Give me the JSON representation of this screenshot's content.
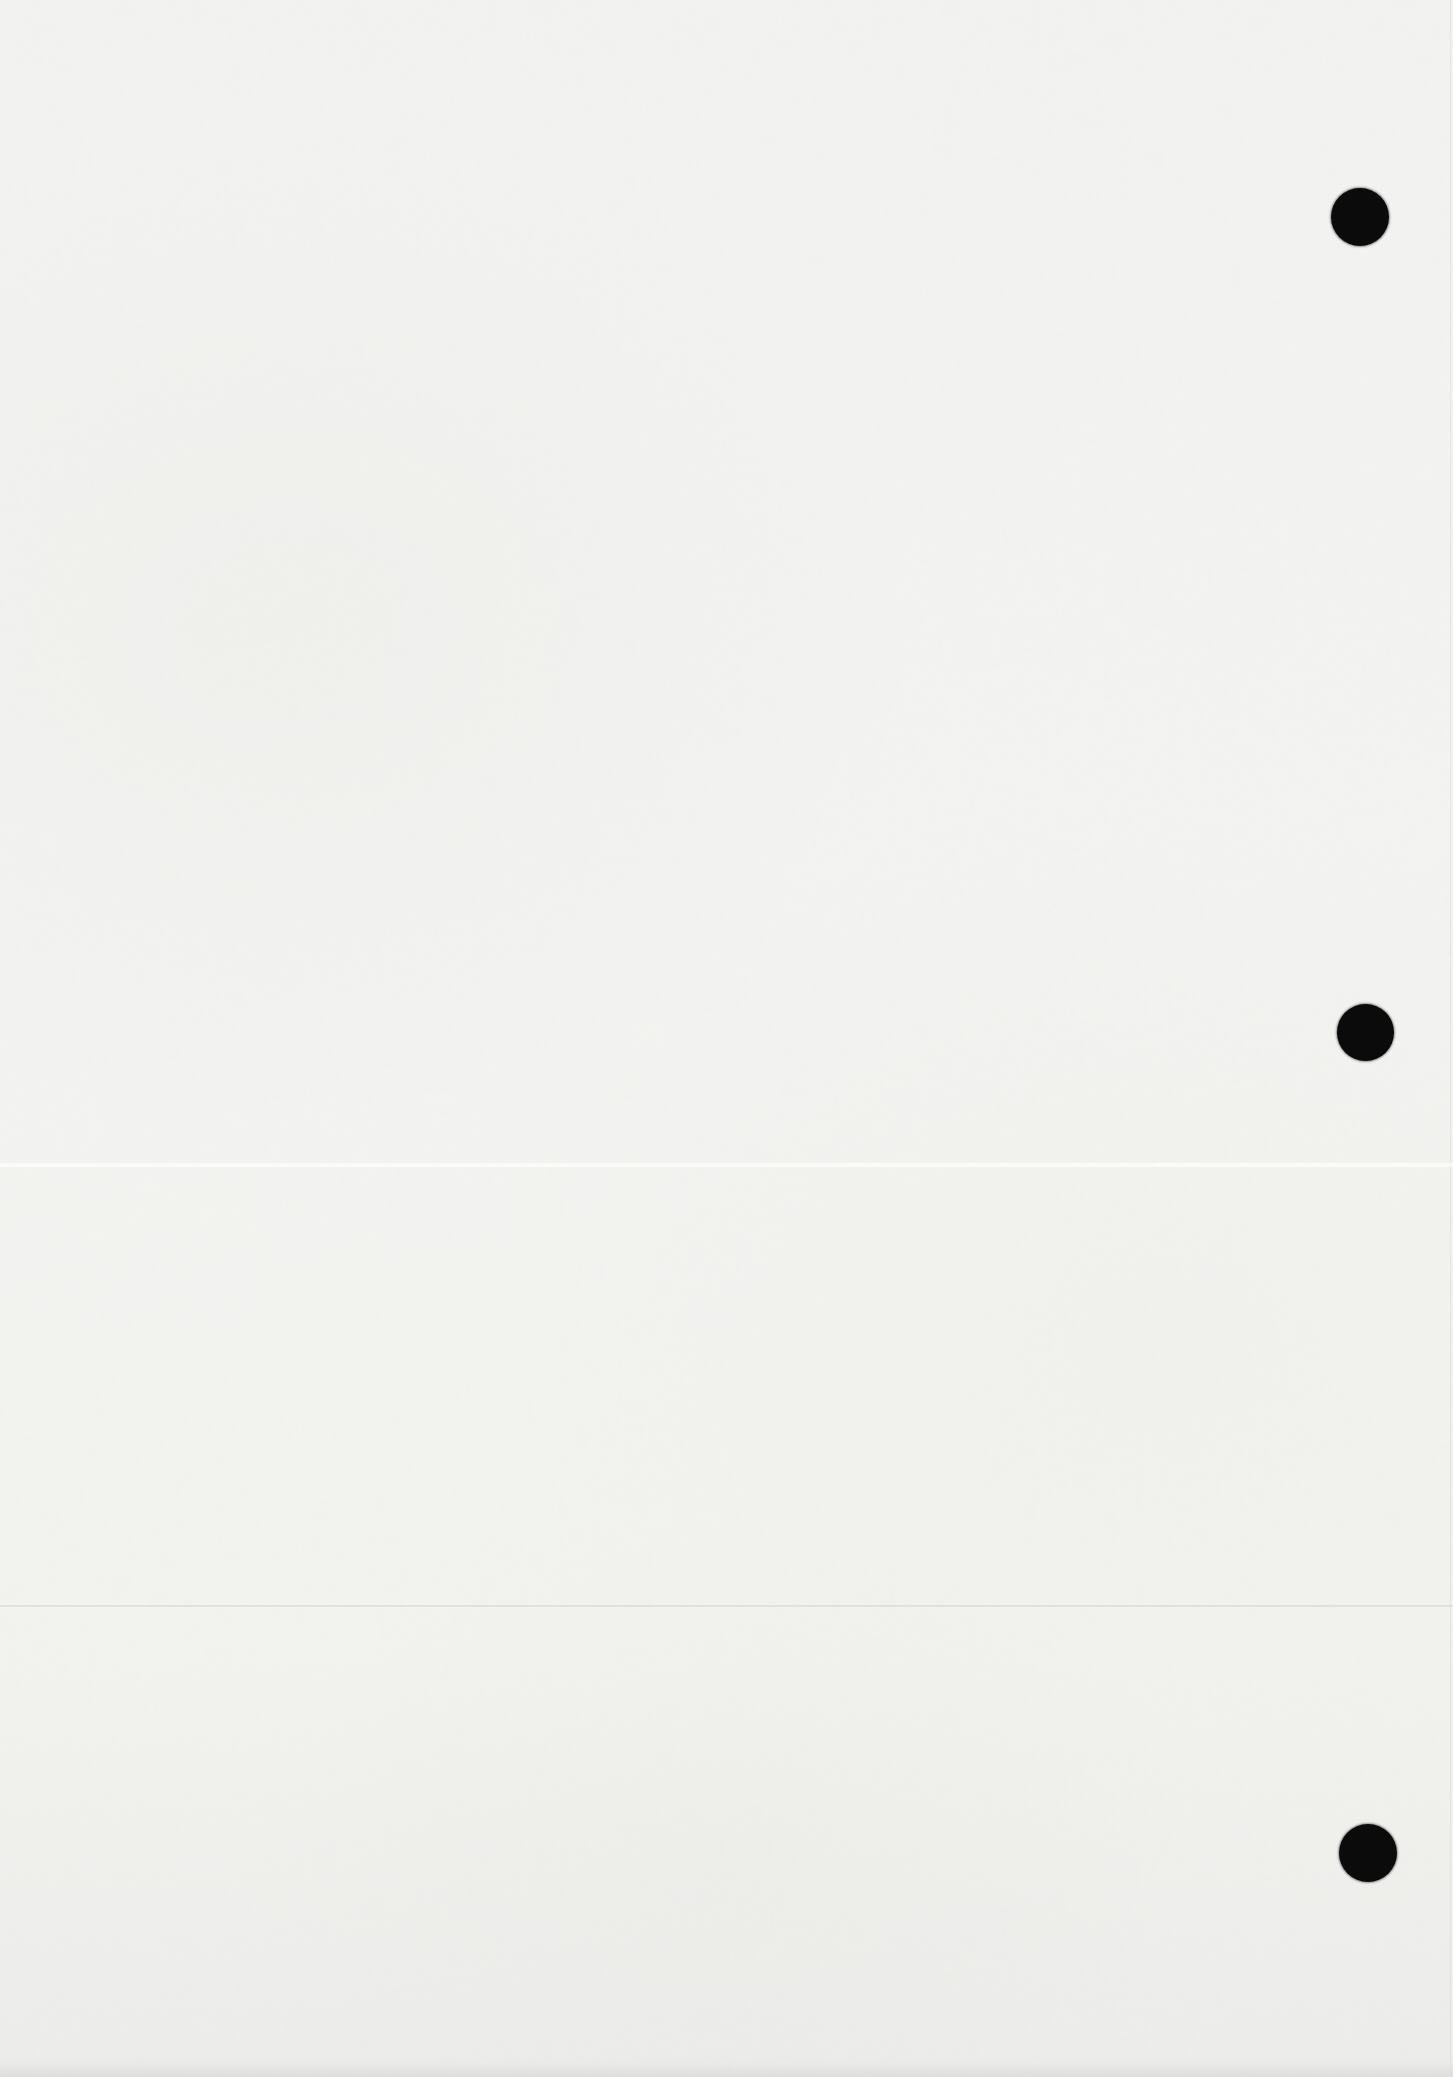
{
  "document": {
    "kind": "blank-scanned-page",
    "paper_color": "#f2f2f0",
    "hole_color": "#0b0b0b",
    "page_width": 1453,
    "page_height": 2077
  },
  "punch_holes": [
    {
      "name": "punch-hole-top",
      "cx": 1360,
      "cy": 217,
      "diameter": 58
    },
    {
      "name": "punch-hole-middle",
      "cx": 1365,
      "cy": 1032,
      "diameter": 57
    },
    {
      "name": "punch-hole-bottom",
      "cx": 1368,
      "cy": 1853,
      "diameter": 58
    }
  ],
  "scan_artifacts": [
    {
      "name": "light-scan-streak",
      "kind": "light",
      "y": 1163,
      "height": 4,
      "color": "rgba(255,255,255,0.65)"
    },
    {
      "name": "faint-scan-line",
      "kind": "dark",
      "y": 1605,
      "height": 2,
      "color": "rgba(190,190,184,0.30)"
    }
  ]
}
